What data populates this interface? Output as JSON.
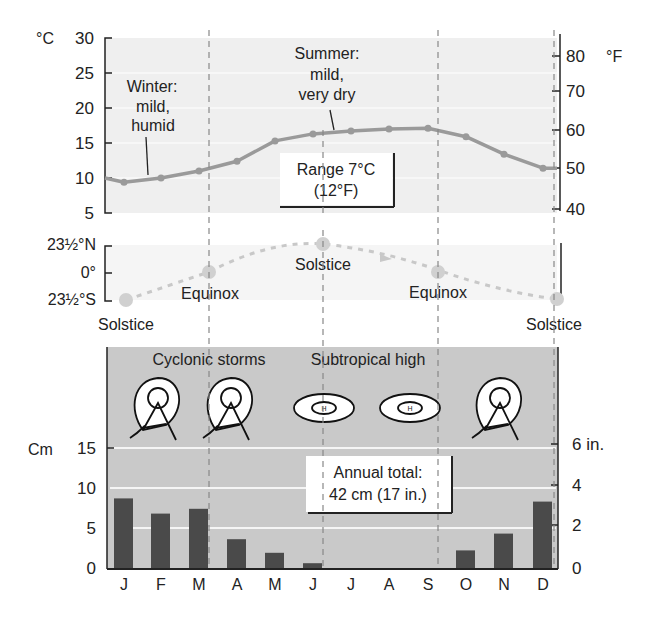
{
  "chart_data": [
    {
      "type": "line",
      "title": "Monthly temperature",
      "categories": [
        "J",
        "F",
        "M",
        "A",
        "M",
        "J",
        "J",
        "A",
        "S",
        "O",
        "N",
        "D"
      ],
      "series": [
        {
          "name": "Temperature (°C)",
          "values": [
            9.4,
            10.0,
            11.0,
            12.4,
            15.3,
            16.3,
            16.7,
            17.0,
            17.1,
            15.9,
            13.4,
            11.4
          ]
        }
      ],
      "ylabel": "°C",
      "ylabel_right": "°F",
      "ylim": [
        5,
        30
      ],
      "yticks": [
        "5",
        "10",
        "15",
        "20",
        "25",
        "30"
      ],
      "yticks_right": [
        "40",
        "50",
        "60",
        "70",
        "80"
      ],
      "annotations": {
        "winter": [
          "Winter:",
          "mild,",
          "humid"
        ],
        "summer": [
          "Summer:",
          "mild,",
          "very dry"
        ],
        "range": [
          "Range 7°C",
          "(12°F)"
        ]
      },
      "grid": true
    },
    {
      "type": "line",
      "title": "Sun declination",
      "yticks": [
        "23½°N",
        "0°",
        "23½°S"
      ],
      "points": [
        {
          "label": "Solstice",
          "position": "S"
        },
        {
          "label": "Equinox",
          "position": "0"
        },
        {
          "label": "Solstice",
          "position": "N"
        },
        {
          "label": "Equinox",
          "position": "0"
        },
        {
          "label": "Solstice",
          "position": "S"
        }
      ]
    },
    {
      "type": "bar",
      "title": "Monthly precipitation",
      "categories": [
        "J",
        "F",
        "M",
        "A",
        "M",
        "J",
        "J",
        "A",
        "S",
        "O",
        "N",
        "D"
      ],
      "values": [
        8.7,
        6.8,
        7.4,
        3.6,
        1.9,
        0.6,
        0,
        0,
        0,
        2.2,
        4.3,
        8.3
      ],
      "ylabel": "Cm",
      "ylabel_right": "in.",
      "ylim": [
        0,
        15
      ],
      "yticks": [
        "0",
        "5",
        "10",
        "15"
      ],
      "yticks_right": [
        "0",
        "2",
        "4",
        "6 in."
      ],
      "annotations": {
        "total": [
          "Annual total:",
          "42 cm (17 in.)"
        ],
        "systems_left": "Cyclonic storms",
        "systems_right": "Subtropical high",
        "high_symbol": "H"
      },
      "grid": true
    }
  ],
  "colors": {
    "panel_light": "#efefef",
    "panel_dark": "#c9c9c9",
    "line": "#9a9a9a",
    "bar": "#4a4a4a",
    "axis": "#222222",
    "declination": "#c8c8c8"
  }
}
